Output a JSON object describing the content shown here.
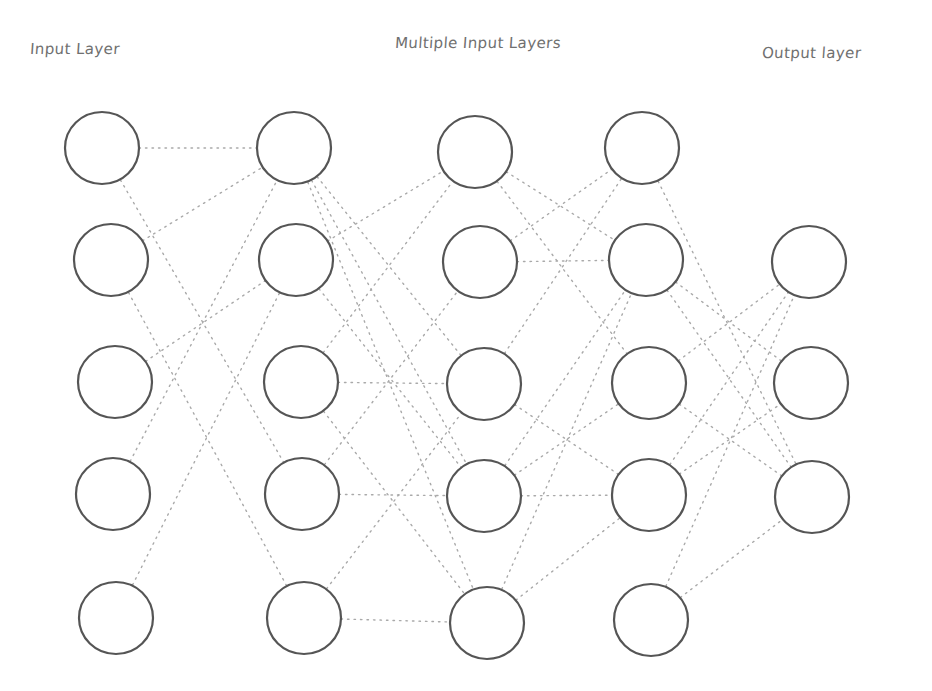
{
  "labels": {
    "input": "Input Layer",
    "hidden": "Multiple Input Layers",
    "output": "Output layer"
  },
  "colors": {
    "background": "#ffffff",
    "node_stroke": "#555555",
    "edge": "#a9a9a9",
    "label": "#707070"
  },
  "node_radius": 37,
  "layers": [
    {
      "name": "input",
      "nodes": [
        [
          102,
          148
        ],
        [
          111,
          260
        ],
        [
          115,
          382
        ],
        [
          113,
          494
        ],
        [
          116,
          618
        ]
      ]
    },
    {
      "name": "hidden-1",
      "nodes": [
        [
          294,
          148
        ],
        [
          296,
          260
        ],
        [
          301,
          382
        ],
        [
          302,
          494
        ],
        [
          304,
          618
        ]
      ]
    },
    {
      "name": "hidden-2",
      "nodes": [
        [
          475,
          152
        ],
        [
          480,
          262
        ],
        [
          484,
          384
        ],
        [
          484,
          496
        ],
        [
          487,
          623
        ]
      ]
    },
    {
      "name": "hidden-3",
      "nodes": [
        [
          642,
          148
        ],
        [
          646,
          260
        ],
        [
          649,
          383
        ],
        [
          649,
          495
        ],
        [
          651,
          620
        ]
      ]
    },
    {
      "name": "output",
      "nodes": [
        [
          809,
          262
        ],
        [
          811,
          383
        ],
        [
          812,
          497
        ]
      ]
    }
  ],
  "edges": [
    [
      [
        0,
        0
      ],
      [
        1,
        0
      ]
    ],
    [
      [
        0,
        0
      ],
      [
        1,
        3
      ]
    ],
    [
      [
        0,
        1
      ],
      [
        1,
        0
      ]
    ],
    [
      [
        0,
        1
      ],
      [
        1,
        4
      ]
    ],
    [
      [
        0,
        2
      ],
      [
        1,
        1
      ]
    ],
    [
      [
        0,
        3
      ],
      [
        1,
        0
      ]
    ],
    [
      [
        0,
        4
      ],
      [
        1,
        1
      ]
    ],
    [
      [
        1,
        0
      ],
      [
        2,
        3
      ]
    ],
    [
      [
        1,
        0
      ],
      [
        2,
        4
      ]
    ],
    [
      [
        1,
        0
      ],
      [
        2,
        2
      ]
    ],
    [
      [
        1,
        1
      ],
      [
        2,
        0
      ]
    ],
    [
      [
        1,
        1
      ],
      [
        2,
        3
      ]
    ],
    [
      [
        1,
        2
      ],
      [
        2,
        0
      ]
    ],
    [
      [
        1,
        2
      ],
      [
        2,
        2
      ]
    ],
    [
      [
        1,
        2
      ],
      [
        2,
        4
      ]
    ],
    [
      [
        1,
        3
      ],
      [
        2,
        1
      ]
    ],
    [
      [
        1,
        3
      ],
      [
        2,
        3
      ]
    ],
    [
      [
        1,
        4
      ],
      [
        2,
        2
      ]
    ],
    [
      [
        1,
        4
      ],
      [
        2,
        4
      ]
    ],
    [
      [
        2,
        0
      ],
      [
        3,
        1
      ]
    ],
    [
      [
        2,
        0
      ],
      [
        3,
        2
      ]
    ],
    [
      [
        2,
        1
      ],
      [
        3,
        0
      ]
    ],
    [
      [
        2,
        1
      ],
      [
        3,
        1
      ]
    ],
    [
      [
        2,
        2
      ],
      [
        3,
        0
      ]
    ],
    [
      [
        2,
        2
      ],
      [
        3,
        3
      ]
    ],
    [
      [
        2,
        3
      ],
      [
        3,
        1
      ]
    ],
    [
      [
        2,
        3
      ],
      [
        3,
        3
      ]
    ],
    [
      [
        2,
        3
      ],
      [
        3,
        2
      ]
    ],
    [
      [
        2,
        4
      ],
      [
        3,
        1
      ]
    ],
    [
      [
        2,
        4
      ],
      [
        3,
        3
      ]
    ],
    [
      [
        3,
        1
      ],
      [
        4,
        2
      ]
    ],
    [
      [
        3,
        1
      ],
      [
        4,
        1
      ]
    ],
    [
      [
        3,
        2
      ],
      [
        4,
        0
      ]
    ],
    [
      [
        3,
        2
      ],
      [
        4,
        2
      ]
    ],
    [
      [
        3,
        3
      ],
      [
        4,
        0
      ]
    ],
    [
      [
        3,
        3
      ],
      [
        4,
        1
      ]
    ],
    [
      [
        3,
        4
      ],
      [
        4,
        0
      ]
    ],
    [
      [
        3,
        4
      ],
      [
        4,
        2
      ]
    ],
    [
      [
        3,
        0
      ],
      [
        4,
        2
      ]
    ]
  ]
}
